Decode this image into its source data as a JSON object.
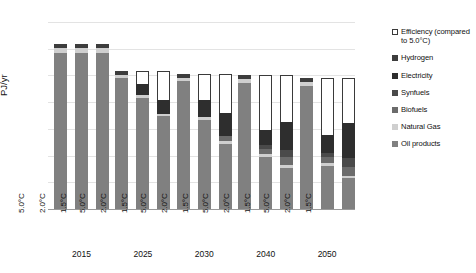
{
  "chart_data": {
    "type": "bar",
    "subtype": "stacked-bar-grouped",
    "title": "",
    "xlabel": "",
    "ylabel": "PJ/yr",
    "ylim": [
      0,
      7000
    ],
    "ytick_labels": [
      "0",
      "1,000",
      "2,000",
      "3,000",
      "4,000",
      "5,000",
      "6,000",
      "7,000"
    ],
    "ytick_values": [
      0,
      1000,
      2000,
      3000,
      4000,
      5000,
      6000,
      7000
    ],
    "grid": true,
    "legend_position": "right",
    "groups": [
      "2015",
      "2025",
      "2030",
      "2040",
      "2050"
    ],
    "scenarios": [
      "5.0°C",
      "2.0°C",
      "1.5°C"
    ],
    "series": [
      {
        "name": "Oil products",
        "color": "#808080",
        "values": [
          [
            5840,
            5840,
            5840
          ],
          [
            4900,
            4170,
            3470
          ],
          [
            4780,
            3350,
            2430
          ],
          [
            4730,
            1930,
            1530
          ],
          [
            4620,
            1600,
            1150
          ]
        ]
      },
      {
        "name": "Natural Gas",
        "color": "#cfcfcf",
        "values": [
          [
            170,
            170,
            170
          ],
          [
            130,
            110,
            90
          ],
          [
            120,
            110,
            100
          ],
          [
            120,
            120,
            120
          ],
          [
            120,
            110,
            100
          ]
        ]
      },
      {
        "name": "Biofuels",
        "color": "#6b6b6b",
        "values": [
          [
            0,
            0,
            0
          ],
          [
            0,
            0,
            0
          ],
          [
            0,
            0,
            210
          ],
          [
            0,
            210,
            300
          ],
          [
            0,
            230,
            330
          ]
        ]
      },
      {
        "name": "Synfuels",
        "color": "#4a4a4a",
        "values": [
          [
            0,
            0,
            0
          ],
          [
            0,
            0,
            0
          ],
          [
            0,
            0,
            0
          ],
          [
            0,
            120,
            260
          ],
          [
            0,
            160,
            340
          ]
        ]
      },
      {
        "name": "Electricity",
        "color": "#2e2e2e",
        "values": [
          [
            0,
            0,
            0
          ],
          [
            0,
            390,
            540
          ],
          [
            0,
            630,
            860
          ],
          [
            0,
            560,
            1060
          ],
          [
            0,
            680,
            1310
          ]
        ]
      },
      {
        "name": "Hydrogen",
        "color": "#3d3d3d",
        "values": [
          [
            170,
            170,
            170
          ],
          [
            140,
            0,
            0
          ],
          [
            150,
            0,
            0
          ],
          [
            150,
            0,
            0
          ],
          [
            160,
            0,
            0
          ]
        ]
      },
      {
        "name": "Efficiency (compared to 5.0°C)",
        "color": "#ffffff",
        "values": [
          [
            0,
            0,
            0
          ],
          [
            0,
            500,
            1080
          ],
          [
            0,
            960,
            1460
          ],
          [
            0,
            2060,
            1730
          ],
          [
            0,
            2120,
            1670
          ]
        ]
      }
    ]
  },
  "legend": {
    "items": [
      {
        "label": "Efficiency (compared to 5.0°C)",
        "swatch": "hollow"
      },
      {
        "label": "Hydrogen",
        "swatch": "solid"
      },
      {
        "label": "Electricity",
        "swatch": "solid"
      },
      {
        "label": "Synfuels",
        "swatch": "solid"
      },
      {
        "label": "Biofuels",
        "swatch": "solid"
      },
      {
        "label": "Natural Gas",
        "swatch": "solid"
      },
      {
        "label": "Oil products",
        "swatch": "solid"
      }
    ]
  },
  "caption": ""
}
